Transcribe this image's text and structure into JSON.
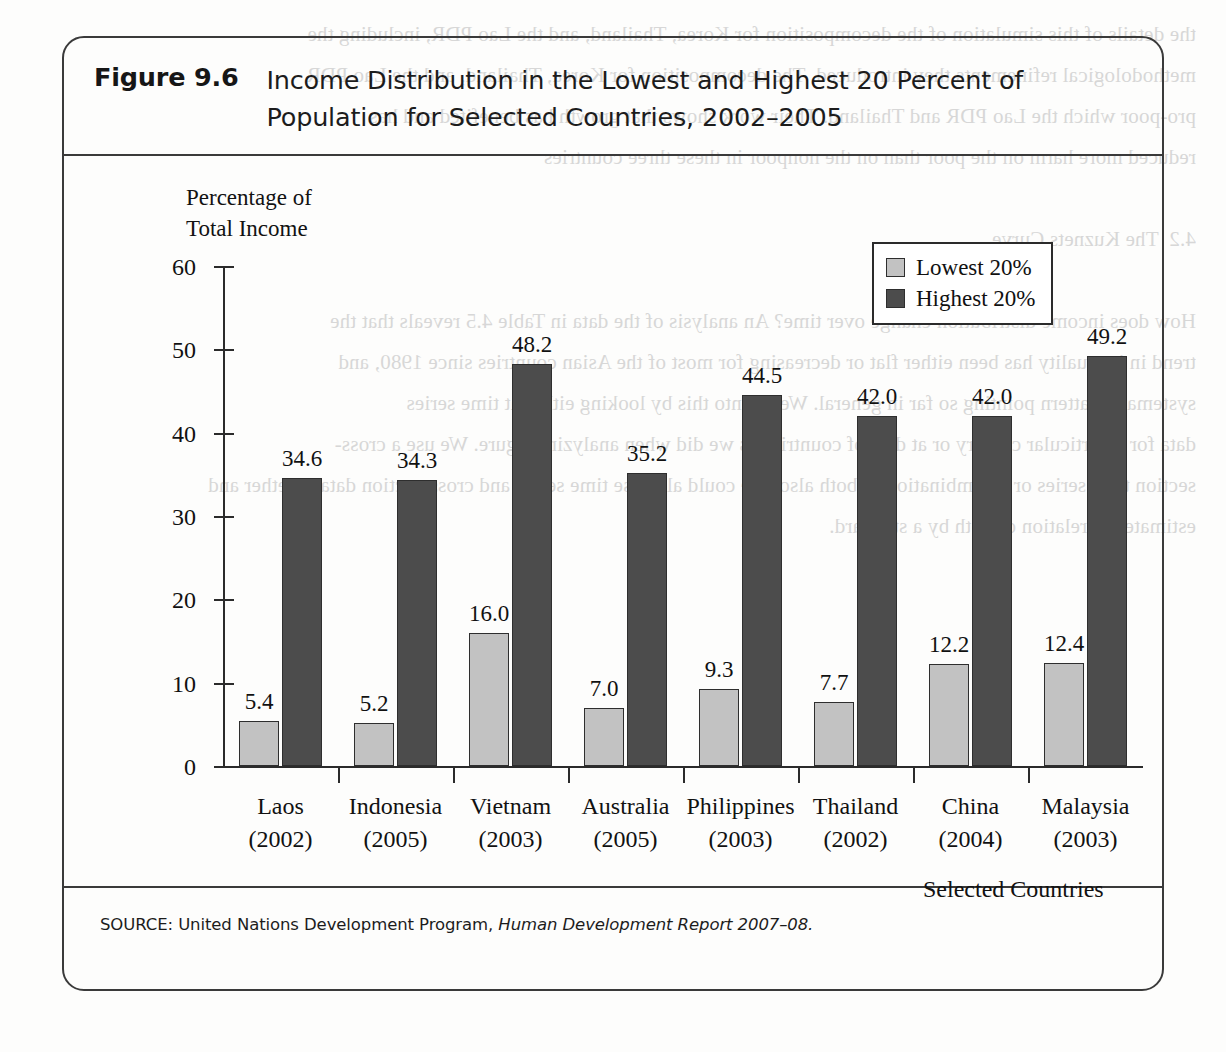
{
  "figure": {
    "number": "Figure 9.6",
    "title": "Income Distribution in the Lowest and Highest 20 Percent of Population for Selected Countries, 2002–2005",
    "source_prefix": "SOURCE: United Nations Development Program, ",
    "source_italic": "Human Development Report 2007–08."
  },
  "colors": {
    "lowest": "#c2c2c2",
    "highest": "#4c4c4c",
    "axis": "#2b2b2b",
    "text": "#111111"
  },
  "chart_data": {
    "type": "bar",
    "title": "Income Distribution in the Lowest and Highest 20 Percent of Population for Selected Countries, 2002–2005",
    "xlabel": "Selected Countries",
    "ylabel": "Percentage of\nTotal Income",
    "ylim": [
      0,
      60
    ],
    "yticks": [
      0,
      10,
      20,
      30,
      40,
      50,
      60
    ],
    "grid": false,
    "legend_position": "top-right",
    "categories": [
      "Laos\n(2002)",
      "Indonesia\n(2005)",
      "Vietnam\n(2003)",
      "Australia\n(2005)",
      "Philippines\n(2003)",
      "Thailand\n(2002)",
      "China\n(2004)",
      "Malaysia\n(2003)"
    ],
    "category_names": [
      "Laos",
      "Indonesia",
      "Vietnam",
      "Australia",
      "Philippines",
      "Thailand",
      "China",
      "Malaysia"
    ],
    "category_years": [
      "(2002)",
      "(2005)",
      "(2003)",
      "(2005)",
      "(2003)",
      "(2002)",
      "(2004)",
      "(2003)"
    ],
    "series": [
      {
        "name": "Lowest 20%",
        "color": "#c2c2c2",
        "values": [
          5.4,
          5.2,
          16.0,
          7.0,
          9.3,
          7.7,
          12.2,
          12.4
        ],
        "labels": [
          "5.4",
          "5.2",
          "16.0",
          "7.0",
          "9.3",
          "7.7",
          "12.2",
          "12.4"
        ]
      },
      {
        "name": "Highest 20%",
        "color": "#4c4c4c",
        "values": [
          34.6,
          34.3,
          48.2,
          35.2,
          44.5,
          42.0,
          42.0,
          49.2
        ],
        "labels": [
          "34.6",
          "34.3",
          "48.2",
          "35.2",
          "44.5",
          "42.0",
          "42.0",
          "49.2"
        ]
      }
    ]
  },
  "bleed_text": "the details of this simulation of the decomposition for Korea, Thailand, and the Lao PDR, including the\nmethodological refinements they introduced. The decomposition for Korea, Thailand, and the Lao PDR\npro-poor which the Lao PDR and Thailand. Their work shows that growth has benefited and has\nreduced more harm on the poor than on the nonpoor in these three countries\n\n4.2  The Kuznets Curve\n\nHow does income distribution change over time? An analysis of the data in Table 4.5 reveals that the\ntrend in inequality has been either flat or decreasing for most of the Asian countries since 1980, and\nsystematic pattern pointing so far in general. We go into this by looking either at time series\ndata for a particular country or at data of countries as we did when analyzing figure. We use a cross-\nsection time series or a combination of both also. We could also use time series and cross-section data together and\nestimate the relation of both by a standard."
}
